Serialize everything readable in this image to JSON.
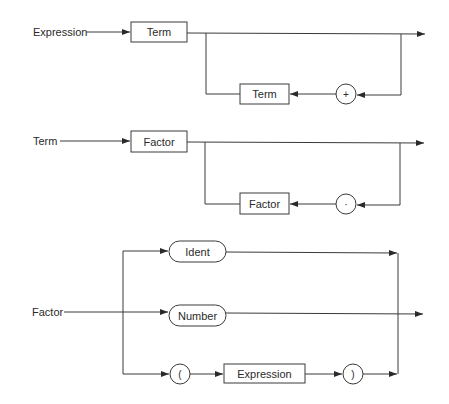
{
  "diagram": {
    "type": "syntax-diagram",
    "rules": [
      {
        "name": "Expression",
        "label": "Expression",
        "first": "Term",
        "loop_item": "Term",
        "loop_separator": "+"
      },
      {
        "name": "Term",
        "label": "Term",
        "first": "Factor",
        "loop_item": "Factor",
        "loop_separator": "·"
      },
      {
        "name": "Factor",
        "label": "Factor",
        "alternatives": [
          {
            "kind": "terminal-pill",
            "text": "Ident"
          },
          {
            "kind": "terminal-pill",
            "text": "Number"
          },
          {
            "kind": "sequence",
            "open": "(",
            "nonterminal": "Expression",
            "close": ")"
          }
        ]
      }
    ]
  },
  "colors": {
    "line": "#3a3a3a",
    "text": "#2a2a2a",
    "background": "#ffffff"
  }
}
